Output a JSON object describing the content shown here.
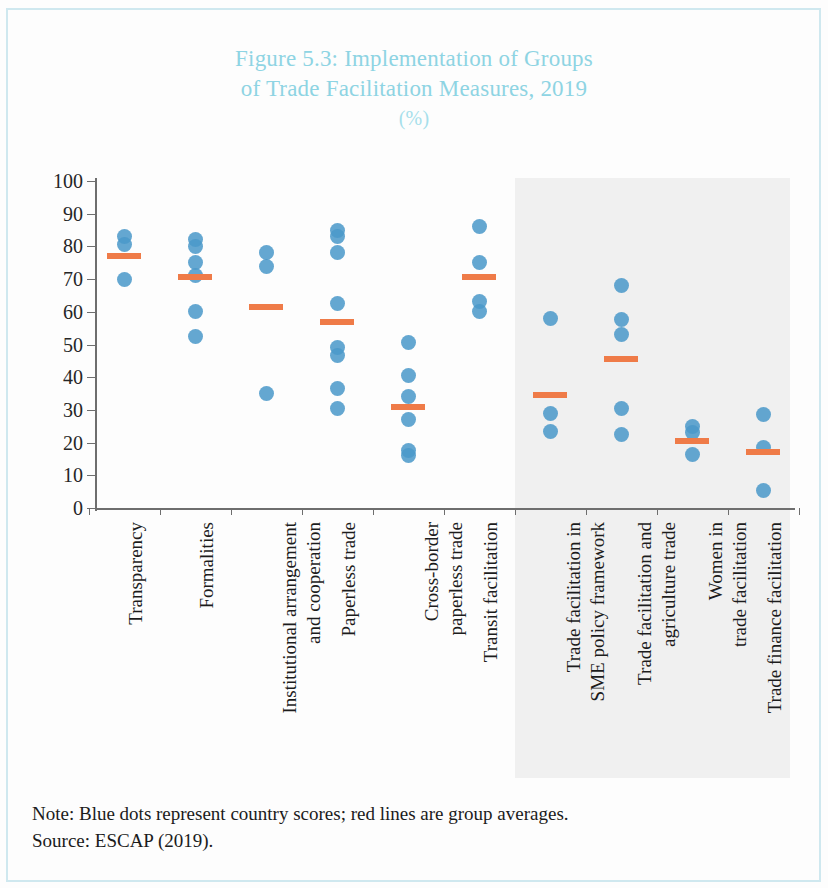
{
  "figure": {
    "title_line1": "Figure 5.3: Implementation of Groups",
    "title_line2": "of Trade Facilitation Measures, 2019",
    "title_unit": "(%)",
    "note": "Note: Blue dots represent country scores; red lines are group averages.",
    "source": "Source: ESCAP (2019)."
  },
  "colors": {
    "title": "#8ed4e3",
    "dot": "#4a98ca",
    "average_line": "#ef7b48",
    "shaded_band": "#f0f0f0",
    "axis": "#6e6e6e",
    "text": "#1c1c1c"
  },
  "chart_data": {
    "type": "scatter",
    "title": "Figure 5.3: Implementation of Groups of Trade Facilitation Measures, 2019 (%)",
    "xlabel": "",
    "ylabel": "(%)",
    "ylim": [
      0,
      100
    ],
    "yticks": [
      0,
      10,
      20,
      30,
      40,
      50,
      60,
      70,
      80,
      90,
      100
    ],
    "grid": false,
    "legend": "none",
    "annotations": [
      "Blue dots represent country scores",
      "Red lines are group averages",
      "Shaded band covers the last four categories"
    ],
    "categories": [
      "Transparency",
      "Formalities",
      "Institutional arrangement and cooperation",
      "Paperless trade",
      "Cross-border paperless trade",
      "Transit facilitation",
      "Trade facilitation in SME policy framework",
      "Trade facilitation and agriculture trade",
      "Women in trade facilitation",
      "Trade finance facilitation"
    ],
    "category_labels": [
      {
        "line1": "Transparency",
        "line2": "",
        "shaded": false
      },
      {
        "line1": "Formalities",
        "line2": "",
        "shaded": false
      },
      {
        "line1": "Institutional arrangement",
        "line2": "and cooperation",
        "shaded": false
      },
      {
        "line1": "Paperless trade",
        "line2": "",
        "shaded": false
      },
      {
        "line1": "Cross-border",
        "line2": "paperless trade",
        "shaded": false
      },
      {
        "line1": "Transit facilitation",
        "line2": "",
        "shaded": false
      },
      {
        "line1": "Trade facilitation in",
        "line2": "SME policy framework",
        "shaded": true
      },
      {
        "line1": "Trade facilitation and",
        "line2": "agriculture trade",
        "shaded": true
      },
      {
        "line1": "Women in",
        "line2": "trade facilitation",
        "shaded": true
      },
      {
        "line1": "Trade finance facilitation",
        "line2": "",
        "shaded": true
      }
    ],
    "series": [
      {
        "name": "Country scores",
        "marker": "dot",
        "points": [
          {
            "category": "Transparency",
            "values": [
              83,
              80.5,
              70
            ]
          },
          {
            "category": "Formalities",
            "values": [
              82,
              80,
              75,
              71,
              60,
              52.5
            ]
          },
          {
            "category": "Institutional arrangement and cooperation",
            "values": [
              78,
              74,
              35
            ]
          },
          {
            "category": "Paperless trade",
            "values": [
              85,
              83,
              78,
              62.5,
              49,
              46.5,
              36.5,
              30.5
            ]
          },
          {
            "category": "Cross-border paperless trade",
            "values": [
              50.5,
              40.5,
              34,
              27,
              17.5,
              16
            ]
          },
          {
            "category": "Transit facilitation",
            "values": [
              86,
              75,
              63,
              60
            ]
          },
          {
            "category": "Trade facilitation in SME policy framework",
            "values": [
              58,
              29,
              23.5
            ]
          },
          {
            "category": "Trade facilitation and agriculture trade",
            "values": [
              68,
              57.5,
              53,
              30.5,
              22.5
            ]
          },
          {
            "category": "Women in trade facilitation",
            "values": [
              25,
              23,
              16.5
            ]
          },
          {
            "category": "Trade finance facilitation",
            "values": [
              28.5,
              18.5,
              5.5
            ]
          }
        ]
      },
      {
        "name": "Group averages",
        "marker": "line",
        "values": [
          77,
          70.5,
          61.5,
          57,
          31,
          70.5,
          34.5,
          45.5,
          20.5,
          17
        ]
      }
    ]
  }
}
